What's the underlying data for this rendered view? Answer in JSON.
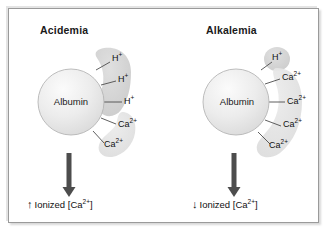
{
  "figure": {
    "background_color": "#ffffff",
    "frame_color": "#9a9a9a"
  },
  "panels": [
    {
      "id": "acidemia",
      "title": "Acidemia",
      "protein": {
        "label": "Albumin",
        "fill_color": "#e8e8e8"
      },
      "blobs": [
        {
          "name": "proton-cloud",
          "ion": "H",
          "fill_color": "#d4d4d4"
        },
        {
          "name": "calcium-cloud",
          "ion": "Ca",
          "fill_color": "#e2e2e2"
        }
      ],
      "bound_ions": [
        {
          "species": "H",
          "text": "H",
          "charge": "+",
          "x": 114,
          "y": 60,
          "tick_angle": -52
        },
        {
          "species": "H",
          "text": "H",
          "charge": "+",
          "x": 120,
          "y": 80,
          "tick_angle": -27
        },
        {
          "species": "H",
          "text": "H",
          "charge": "+",
          "x": 126,
          "y": 102,
          "tick_angle": 0
        },
        {
          "species": "Ca",
          "text": "Ca",
          "charge": "2+",
          "x": 120,
          "y": 126,
          "tick_angle": 29
        },
        {
          "species": "Ca",
          "text": "Ca",
          "charge": "2+",
          "x": 106,
          "y": 147,
          "tick_angle": 55
        }
      ],
      "counts": {
        "H": 3,
        "Ca": 2
      },
      "arrow": {
        "name": "downward-arrow",
        "color": "#4a4a4a"
      },
      "outcome": {
        "direction": "up",
        "direction_glyph": "↑",
        "text": "Ionized [Ca",
        "charge": "2+",
        "text_end": "]",
        "full_text": "↑ Ionized [Ca2+]"
      }
    },
    {
      "id": "alkalemia",
      "title": "Alkalemia",
      "protein": {
        "label": "Albumin",
        "fill_color": "#e8e8e8"
      },
      "blobs": [
        {
          "name": "proton-cloud",
          "ion": "H",
          "fill_color": "#dcdcdc"
        },
        {
          "name": "calcium-cloud",
          "ion": "Ca",
          "fill_color": "#e2e2e2"
        }
      ],
      "bound_ions": [
        {
          "species": "H",
          "text": "H",
          "charge": "+",
          "x": 280,
          "y": 58,
          "tick_angle": -57
        },
        {
          "species": "Ca",
          "text": "Ca",
          "charge": "2+",
          "x": 284,
          "y": 78,
          "tick_angle": -31
        },
        {
          "species": "Ca",
          "text": "Ca",
          "charge": "2+",
          "x": 289,
          "y": 102,
          "tick_angle": -2
        },
        {
          "species": "Ca",
          "text": "Ca",
          "charge": "2+",
          "x": 285,
          "y": 126,
          "tick_angle": 27
        },
        {
          "species": "Ca",
          "text": "Ca",
          "charge": "2+",
          "x": 272,
          "y": 148,
          "tick_angle": 54
        }
      ],
      "counts": {
        "H": 1,
        "Ca": 4
      },
      "arrow": {
        "name": "downward-arrow",
        "color": "#4a4a4a"
      },
      "outcome": {
        "direction": "down",
        "direction_glyph": "↓",
        "text": "Ionized [Ca",
        "charge": "2+",
        "text_end": "]",
        "full_text": "↓ Ionized [Ca2+]"
      }
    }
  ]
}
